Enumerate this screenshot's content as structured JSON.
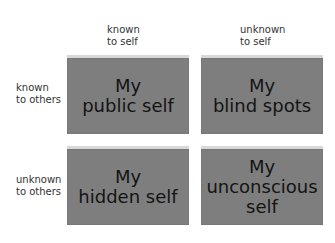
{
  "columns": [
    {
      "label": "known\nto self"
    },
    {
      "label": "unknown\nto self"
    }
  ],
  "rows": [
    {
      "label": "known\nto others"
    },
    {
      "label": "unknown\nto others"
    }
  ],
  "quadrants": [
    {
      "text": "My\npublic self"
    },
    {
      "text": "My\nblind spots"
    },
    {
      "text": "My\nhidden self"
    },
    {
      "text": "My\nunconscious\nself"
    }
  ],
  "colors": {
    "box": "#7e7e7e",
    "bevel": "#d8d8d8",
    "text": "#141414"
  }
}
